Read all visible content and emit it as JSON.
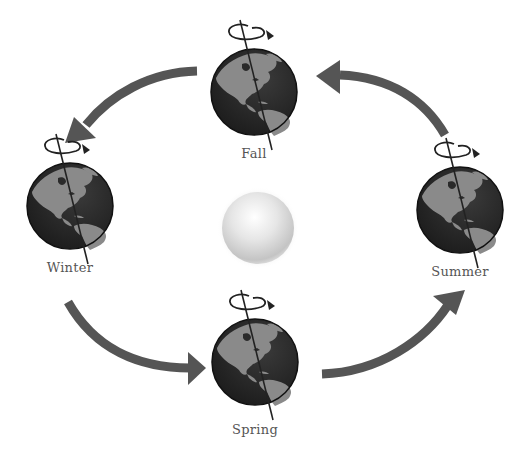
{
  "diagram": {
    "colors": {
      "arrow": "#555555",
      "ocean": "#2a2a2a",
      "land": "#8a8a8a",
      "axis": "#222222",
      "sun_light": "#ffffff",
      "sun_dark": "#bdbdbd",
      "label": "#555555"
    },
    "sun": {
      "name": "sun",
      "cx": 258,
      "cy": 228,
      "r": 37
    },
    "seasons": [
      {
        "id": "fall",
        "label": "Fall",
        "cx": 254,
        "cy": 92,
        "r": 43,
        "label_x": 254,
        "label_y": 146
      },
      {
        "id": "winter",
        "label": "Winter",
        "cx": 70,
        "cy": 206,
        "r": 43,
        "label_x": 70,
        "label_y": 260
      },
      {
        "id": "summer",
        "label": "Summer",
        "cx": 460,
        "cy": 210,
        "r": 43,
        "label_x": 460,
        "label_y": 264
      },
      {
        "id": "spring",
        "label": "Spring",
        "cx": 255,
        "cy": 362,
        "r": 43,
        "label_x": 255,
        "label_y": 422
      }
    ],
    "arrows": [
      {
        "id": "summer-to-fall",
        "from": "Summer",
        "to": "Fall"
      },
      {
        "id": "fall-to-winter",
        "from": "Fall",
        "to": "Winter"
      },
      {
        "id": "winter-to-spring",
        "from": "Winter",
        "to": "Spring"
      },
      {
        "id": "spring-to-summer",
        "from": "Spring",
        "to": "Summer"
      }
    ]
  }
}
